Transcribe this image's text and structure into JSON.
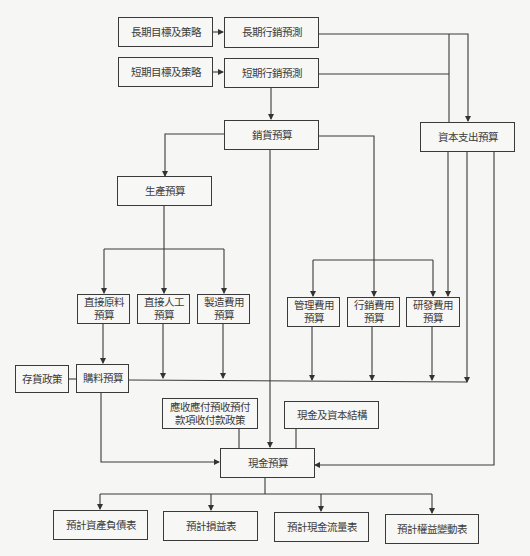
{
  "diagram": {
    "nodes": {
      "long_goal": {
        "label": "長期目標及策略"
      },
      "long_forecast": {
        "label": "長期行銷預測"
      },
      "short_goal": {
        "label": "短期目標及策略"
      },
      "short_forecast": {
        "label": "短期行銷預測"
      },
      "sales_budget": {
        "label": "銷貨預算"
      },
      "capex_budget": {
        "label": "資本支出預算"
      },
      "production_budget": {
        "label": "生產預算"
      },
      "direct_material": {
        "line1": "直接原料",
        "line2": "預算"
      },
      "direct_labor": {
        "line1": "直接人工",
        "line2": "預算"
      },
      "mfg_overhead": {
        "line1": "製造費用",
        "line2": "預算"
      },
      "admin_expense": {
        "line1": "管理費用",
        "line2": "預算"
      },
      "selling_expense": {
        "line1": "行銷費用",
        "line2": "預算"
      },
      "rd_expense": {
        "line1": "研發費用",
        "line2": "預算"
      },
      "inventory_policy": {
        "label": "存貨政策"
      },
      "purchase_budget": {
        "label": "購料預算"
      },
      "ar_ap_policy": {
        "line1": "應收應付預收預付",
        "line2": "款項收付款政策"
      },
      "cash_capital_structure": {
        "label": "現金及資本結構"
      },
      "cash_budget": {
        "label": "現金預算"
      },
      "pro_forma_balance_sheet": {
        "label": "預計資產負債表"
      },
      "pro_forma_income_statement": {
        "label": "預計損益表"
      },
      "pro_forma_cash_flow": {
        "label": "預計現金流量表"
      },
      "pro_forma_equity_changes": {
        "label": "預計權益變動表"
      }
    },
    "edges": [
      [
        "長期目標及策略",
        "長期行銷預測"
      ],
      [
        "短期目標及策略",
        "短期行銷預測"
      ],
      [
        "長期行銷預測",
        "資本支出預算"
      ],
      [
        "短期行銷預測",
        "資本支出預算"
      ],
      [
        "短期行銷預測",
        "銷貨預算"
      ],
      [
        "銷貨預算",
        "生產預算"
      ],
      [
        "銷貨預算",
        "現金預算"
      ],
      [
        "銷貨預算",
        "管理費用預算"
      ],
      [
        "銷貨預算",
        "行銷費用預算"
      ],
      [
        "銷貨預算",
        "研發費用預算"
      ],
      [
        "資本支出預算",
        "研發費用預算"
      ],
      [
        "資本支出預算",
        "現金預算"
      ],
      [
        "生產預算",
        "直接原料預算"
      ],
      [
        "生產預算",
        "直接人工預算"
      ],
      [
        "生產預算",
        "製造費用預算"
      ],
      [
        "直接原料預算",
        "購料預算"
      ],
      [
        "存貨政策",
        "購料預算"
      ],
      [
        "購料預算",
        "現金預算"
      ],
      [
        "直接人工預算",
        "現金預算"
      ],
      [
        "製造費用預算",
        "現金預算"
      ],
      [
        "管理費用預算",
        "現金預算"
      ],
      [
        "行銷費用預算",
        "現金預算"
      ],
      [
        "研發費用預算",
        "現金預算"
      ],
      [
        "應收應付預收預付款項收付款政策",
        "現金預算"
      ],
      [
        "現金及資本結構",
        "現金預算"
      ],
      [
        "現金預算",
        "預計資產負債表"
      ],
      [
        "現金預算",
        "預計損益表"
      ],
      [
        "現金預算",
        "預計現金流量表"
      ],
      [
        "現金預算",
        "預計權益變動表"
      ]
    ],
    "colors": {
      "line": "#3a3a3a",
      "background": "#f6f6f4",
      "box_border": "#3a3a3a",
      "text": "#3b3b3b"
    }
  }
}
